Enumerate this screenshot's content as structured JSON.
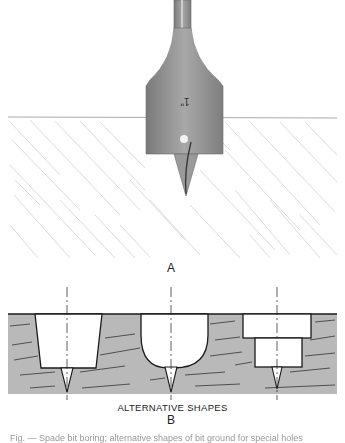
{
  "figure": {
    "part_a": {
      "label": "A",
      "tool": "spade-bit",
      "blade_marking": "1\"",
      "wood_surface": "hatched-wood-grain"
    },
    "part_b": {
      "label": "B",
      "subtitle": "ALTERNATIVE SHAPES",
      "shapes": [
        {
          "name": "tapered",
          "description": "tapered flat-bottom hole with spur"
        },
        {
          "name": "rounded",
          "description": "round-bottom hole with spur"
        },
        {
          "name": "stepped",
          "description": "stepped counterbore hole with spur"
        }
      ]
    },
    "caption_partial": "Fig. — Spade bit boring; alternative shapes of bit ground for special holes"
  },
  "colors": {
    "steel": "#8e8e8e",
    "wood_fill": "#b9b9b9",
    "line": "#1a1a1a",
    "hatch": "#cfcfcf"
  }
}
